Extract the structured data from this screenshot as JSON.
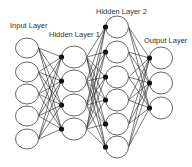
{
  "diagram": {
    "type": "neural-network",
    "colors": {
      "node_stroke": "#666666",
      "edge": "#222222",
      "dot": "#111111",
      "text": "#333333",
      "background": "#ffffff"
    },
    "layers": [
      {
        "id": "input",
        "label": "Input Layer",
        "label_x": 10,
        "label_y": 28,
        "cx": 27,
        "rx": 11.5,
        "ry": 10,
        "nodes_y": [
          48,
          72,
          94,
          116,
          139
        ],
        "input_dot": false
      },
      {
        "id": "hidden1",
        "label": "Hidden Layer 1",
        "label_x": 49,
        "label_y": 37,
        "cx": 74,
        "rx": 12.5,
        "ry": 11,
        "nodes_y": [
          57,
          81,
          105,
          129
        ],
        "input_dot": true
      },
      {
        "id": "hidden2",
        "label": "Hidden Layer 2",
        "label_x": 96,
        "label_y": 14,
        "cx": 117,
        "rx": 11.5,
        "ry": 11,
        "nodes_y": [
          27,
          52,
          77,
          100,
          124,
          147
        ],
        "input_dot": true
      },
      {
        "id": "output",
        "label": "Output Layer",
        "label_x": 144,
        "label_y": 43,
        "cx": 161,
        "rx": 11.5,
        "ry": 11,
        "nodes_y": [
          58,
          83,
          108
        ],
        "input_dot": true
      }
    ]
  }
}
